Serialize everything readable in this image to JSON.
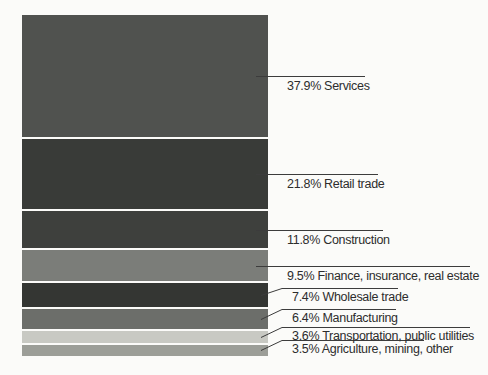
{
  "figure": {
    "background": "#fbfbf9",
    "text_color": "#2d2d2d",
    "line_color": "#3c3c3c"
  },
  "chart_data": {
    "type": "bar",
    "subtype": "stacked-percentage-column",
    "title": "",
    "unit": "%",
    "grid": false,
    "axes": false,
    "legend_position": "right-callouts",
    "categories": [
      "Services",
      "Retail trade",
      "Construction",
      "Finance, insurance, real estate",
      "Wholesale trade",
      "Manufacturing",
      "Transportation, public utilities",
      "Agriculture, mining, other"
    ],
    "values": [
      37.9,
      21.8,
      11.8,
      9.5,
      7.4,
      6.4,
      3.6,
      3.5
    ],
    "labels": [
      "37.9% Services",
      "21.8% Retail trade",
      "11.8% Construction",
      "9.5% Finance, insurance, real estate",
      "7.4% Wholesale trade",
      "6.4% Manufacturing",
      "3.6% Transportation, public utilities",
      "3.5% Agriculture, mining, other"
    ],
    "colors": [
      "#50524f",
      "#393b38",
      "#3e403d",
      "#7b7d79",
      "#343633",
      "#6c6e6a",
      "#c8c9c3",
      "#9c9e98"
    ]
  }
}
